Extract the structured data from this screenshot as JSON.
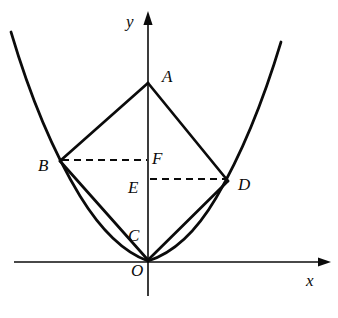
{
  "figure": {
    "kind": "geometry-diagram",
    "background_color": "#ffffff",
    "stroke_color": "#0b0b0b"
  },
  "axes": {
    "x_axis": {
      "label": "x",
      "label_x": 306,
      "label_y": 272,
      "y": 262,
      "x_start": 14,
      "x_end": 331,
      "arrow": "right"
    },
    "y_axis": {
      "label": "y",
      "label_x": 126,
      "label_y": 13,
      "x": 148,
      "y_start": 296,
      "y_end": 13,
      "arrow": "up"
    }
  },
  "curve": {
    "name": "parabola",
    "type": "upward-parabola",
    "vertex": [
      148,
      261
    ],
    "left_end": [
      11,
      32
    ],
    "right_end": [
      281,
      42
    ],
    "stroke_width": 2.6
  },
  "points": [
    {
      "id": "A",
      "label": "A",
      "x": 148,
      "y": 83,
      "label_x": 162,
      "label_y": 68,
      "on_curve": false
    },
    {
      "id": "B",
      "label": "B",
      "x": 60,
      "y": 161,
      "label_x": 38,
      "label_y": 157,
      "on_curve": true
    },
    {
      "id": "C",
      "label": "C",
      "x": 148,
      "y": 259,
      "label_x": 128,
      "label_y": 227,
      "on_curve": false
    },
    {
      "id": "D",
      "label": "D",
      "x": 228,
      "y": 181,
      "label_x": 238,
      "label_y": 176,
      "on_curve": true
    },
    {
      "id": "E",
      "label": "E",
      "x": 148,
      "y": 180,
      "label_x": 128,
      "label_y": 179,
      "on_curve": false
    },
    {
      "id": "F",
      "label": "F",
      "x": 148,
      "y": 161,
      "label_x": 152,
      "label_y": 150,
      "on_curve": false
    },
    {
      "id": "O",
      "label": "O",
      "x": 148,
      "y": 262,
      "label_x": 131,
      "label_y": 262,
      "on_curve": true
    }
  ],
  "solid_segments": [
    {
      "name": "segment-AB",
      "from": "A",
      "to": "B",
      "x1": 148,
      "y1": 83,
      "x2": 60,
      "y2": 161
    },
    {
      "name": "segment-AD",
      "from": "A",
      "to": "D",
      "x1": 148,
      "y1": 83,
      "x2": 228,
      "y2": 181
    },
    {
      "name": "segment-BC",
      "from": "B",
      "to": "C",
      "x1": 60,
      "y1": 161,
      "x2": 148,
      "y2": 260
    },
    {
      "name": "segment-CD",
      "from": "C",
      "to": "D",
      "x1": 148,
      "y1": 260,
      "x2": 228,
      "y2": 181
    }
  ],
  "dashed_segments": [
    {
      "name": "segment-BF",
      "from": "B",
      "to": "F",
      "x1": 62,
      "y1": 160,
      "x2": 147,
      "y2": 160
    },
    {
      "name": "segment-ED",
      "from": "E",
      "to": "D",
      "x1": 150,
      "y1": 179,
      "x2": 227,
      "y2": 179
    }
  ]
}
